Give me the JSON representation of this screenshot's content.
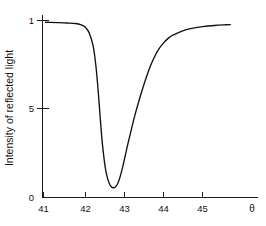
{
  "chart_data": {
    "type": "line",
    "title": "",
    "subtitle": "",
    "xlabel": "θ",
    "ylabel": "Intensity of reflected light",
    "xlim": [
      40.8,
      45.9
    ],
    "ylim": [
      0,
      1.06
    ],
    "grid": false,
    "legend": null,
    "x_ticks": [
      {
        "value": 41,
        "label": "41"
      },
      {
        "value": 42,
        "label": "42"
      },
      {
        "value": 43,
        "label": "43"
      },
      {
        "value": 44,
        "label": "44"
      },
      {
        "value": 45,
        "label": "45"
      }
    ],
    "y_ticks": [
      {
        "value": 0,
        "label": "0"
      },
      {
        "value": 0.5,
        "label": "5"
      },
      {
        "value": 1.0,
        "label": "1"
      }
    ],
    "series": [
      {
        "name": "reflected intensity",
        "color": "#111111",
        "x": [
          41.05,
          41.2,
          41.4,
          41.6,
          41.8,
          41.95,
          42.05,
          42.15,
          42.25,
          42.32,
          42.38,
          42.42,
          42.46,
          42.5,
          42.55,
          42.6,
          42.65,
          42.7,
          42.75,
          42.8,
          42.85,
          42.9,
          42.95,
          43.0,
          43.05,
          43.12,
          43.2,
          43.3,
          43.4,
          43.5,
          43.6,
          43.7,
          43.8,
          43.9,
          44.0,
          44.15,
          44.3,
          44.5,
          44.7,
          45.0,
          45.3,
          45.6,
          45.7
        ],
        "y": [
          0.99,
          0.989,
          0.988,
          0.986,
          0.983,
          0.975,
          0.962,
          0.93,
          0.855,
          0.74,
          0.59,
          0.47,
          0.355,
          0.265,
          0.175,
          0.118,
          0.082,
          0.062,
          0.055,
          0.058,
          0.072,
          0.098,
          0.135,
          0.18,
          0.23,
          0.3,
          0.375,
          0.465,
          0.545,
          0.62,
          0.688,
          0.748,
          0.798,
          0.838,
          0.868,
          0.902,
          0.922,
          0.942,
          0.954,
          0.965,
          0.972,
          0.976,
          0.977
        ]
      }
    ],
    "annotations": []
  },
  "figure": {
    "background_color": "#ffffff",
    "axis_color": "#1a1a1a",
    "curve_color": "#111111"
  }
}
